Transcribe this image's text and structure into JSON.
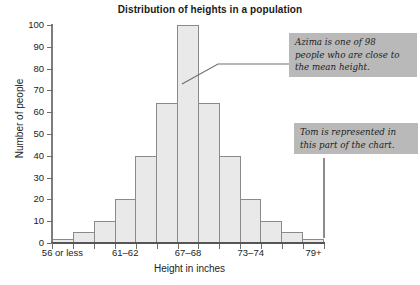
{
  "chart_data": {
    "type": "bar",
    "title": "Distribution of heights in a population",
    "xlabel": "Height in inches",
    "ylabel": "Number of people",
    "categories": [
      "56 or less",
      "57–58",
      "59–60",
      "61–62",
      "63–64",
      "65–66",
      "67–68",
      "69–70",
      "71–72",
      "73–74",
      "75–76",
      "77–78",
      "79+"
    ],
    "values": [
      2,
      5,
      10,
      20,
      40,
      64,
      100,
      64,
      40,
      20,
      10,
      5,
      2
    ],
    "ylim": [
      0,
      100
    ],
    "ytick_values": [
      0,
      10,
      20,
      30,
      40,
      50,
      60,
      70,
      80,
      90,
      100
    ],
    "ytick_labels": [
      "0",
      "10",
      "20",
      "30",
      "40",
      "50",
      "60",
      "70",
      "80",
      "90",
      "100"
    ],
    "xtick_labels": [
      "56 or less",
      "61–62",
      "67–68",
      "73–74",
      "79+"
    ],
    "xtick_indices": [
      0,
      3,
      6,
      9,
      12
    ],
    "grid": false,
    "legend": null,
    "bar_fill": "#e9e9e9",
    "bar_border": "#8a8a8a",
    "annotations": [
      {
        "name": "azima",
        "text": "Azima is one of 98 people who are close to the mean height.",
        "background": "#b9b9b9",
        "points_to_category": "67–68"
      },
      {
        "name": "tom",
        "text": "Tom is represented in this part of the chart.",
        "background": "#b9b9b9",
        "points_to_category": "79+"
      }
    ]
  },
  "annotations_display": {
    "azima_line1": "Azima is one of 98",
    "azima_line2": "people who are close to",
    "azima_line3": "the mean height.",
    "tom_line1": "Tom is represented in",
    "tom_line2": "this part of the chart."
  }
}
